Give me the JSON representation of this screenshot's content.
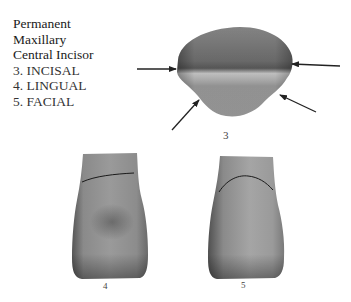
{
  "title": {
    "line1": "Permanent",
    "line2": "Maxillary",
    "line3": "Central Incisor"
  },
  "legend": [
    {
      "number": "3",
      "label": "3. INCISAL"
    },
    {
      "number": "4",
      "label": "4. LINGUAL"
    },
    {
      "number": "5",
      "label": "5. FACIAL"
    }
  ],
  "figures": {
    "incisal": {
      "label": "3"
    },
    "lingual": {
      "label": "4"
    },
    "facial": {
      "label": "5"
    }
  },
  "arrows": [
    {
      "name": "left-arrow",
      "from": [
        137,
        69
      ],
      "to": [
        176,
        69
      ]
    },
    {
      "name": "right-arrow",
      "from": [
        340,
        66
      ],
      "to": [
        291,
        64
      ]
    },
    {
      "name": "lower-left-arrow",
      "from": [
        172,
        130
      ],
      "to": [
        199,
        99
      ]
    },
    {
      "name": "lower-right-arrow",
      "from": [
        316,
        112
      ],
      "to": [
        280,
        95
      ]
    }
  ]
}
